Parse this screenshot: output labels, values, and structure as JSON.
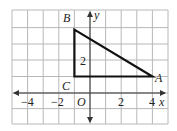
{
  "diagram": {
    "type": "coordinate-plane",
    "colors": {
      "grid": "#b8b8b8",
      "axis": "#333333",
      "triangle": "#111111",
      "text": "#222222"
    },
    "grid": {
      "x_min": -5,
      "x_max": 5,
      "y_min": -2,
      "y_max": 5,
      "step": 1
    },
    "axes": {
      "x_label": "x",
      "y_label": "y",
      "origin_label": "O"
    },
    "x_tick_labels": [
      {
        "value": -4,
        "text": "−4"
      },
      {
        "value": -2,
        "text": "−2"
      },
      {
        "value": 2,
        "text": "2"
      },
      {
        "value": 4,
        "text": "4"
      }
    ],
    "y_tick_labels": [
      {
        "value": 2,
        "text": "2"
      }
    ],
    "triangle": {
      "vertices": [
        {
          "label": "A",
          "x": 4,
          "y": 1
        },
        {
          "label": "B",
          "x": -1,
          "y": 4
        },
        {
          "label": "C",
          "x": -1,
          "y": 1
        }
      ]
    }
  }
}
